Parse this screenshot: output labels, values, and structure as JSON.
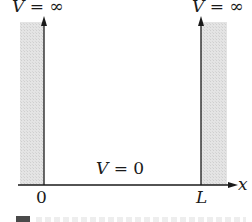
{
  "diagram": {
    "left_wall": {
      "label_symbol": "V",
      "label_eq": " = ",
      "label_value": "∞",
      "position": "0"
    },
    "right_wall": {
      "label_symbol": "V",
      "label_eq": " = ",
      "label_value": "∞",
      "position": "L"
    },
    "interior": {
      "label_symbol": "V",
      "label_eq": " = ",
      "label_value": "0"
    },
    "axis": {
      "label": "x",
      "origin_tick": "0",
      "end_tick": "L"
    },
    "colors": {
      "wall_fill": "#dcdcdc",
      "line": "#1a1a1a",
      "text": "#1a1a1a"
    }
  }
}
